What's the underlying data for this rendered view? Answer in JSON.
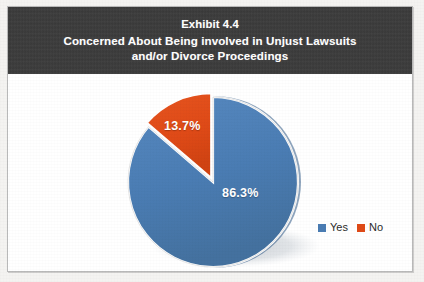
{
  "exhibit": {
    "title_lines": [
      "Exhibit 4.4",
      "Concerned About Being involved in Unjust Lawsuits",
      "and/or Divorce Proceedings"
    ],
    "band_color": "#3b3b3b",
    "border_color": "#b9b9b9"
  },
  "legend": {
    "items": [
      {
        "label": "Yes",
        "color": "#4a7cb3"
      },
      {
        "label": "No",
        "color": "#df4a17"
      }
    ]
  },
  "labels": {
    "yes": "86.3%",
    "no": "13.7%"
  },
  "chart_data": {
    "type": "pie",
    "categories": [
      "Yes",
      "No"
    ],
    "values": [
      86.3,
      13.7
    ],
    "value_labels": [
      "86.3%",
      "13.7%"
    ],
    "colors": [
      "#4a7cb3",
      "#df4a17"
    ],
    "units": "percent",
    "start_angle_deg": 0,
    "direction": "clockwise",
    "exploded_slices": [
      "No"
    ],
    "legend_position": "right",
    "grid": false,
    "xlabel": "",
    "ylabel": ""
  }
}
